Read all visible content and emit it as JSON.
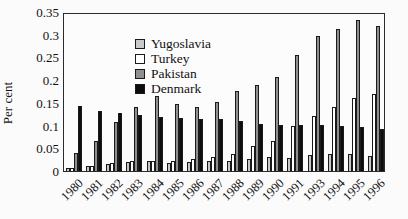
{
  "chart_data": {
    "type": "bar",
    "title": "",
    "xlabel": "",
    "ylabel": "Per cent",
    "ylim": [
      0,
      0.35
    ],
    "grid": false,
    "legend_position": "top-left-inside",
    "y_tick_labels": [
      "0",
      "0.05",
      "0.1",
      "0.15",
      "0.2",
      "0.25",
      "0.3",
      "0.35"
    ],
    "categories": [
      "1980",
      "1981",
      "1982",
      "1983",
      "1984",
      "1985",
      "1986",
      "1987",
      "1988",
      "1989",
      "1990",
      "1991",
      "1993",
      "1994",
      "1995",
      "1996"
    ],
    "series": [
      {
        "name": "Yugoslavia",
        "color": "#c9c9c9",
        "values": [
          0.007,
          0.01,
          0.016,
          0.02,
          0.021,
          0.018,
          0.019,
          0.021,
          0.023,
          0.027,
          0.031,
          0.029,
          0.036,
          0.037,
          0.037,
          0.034
        ]
      },
      {
        "name": "Turkey",
        "color": "#ffffff",
        "values": [
          0.007,
          0.011,
          0.018,
          0.021,
          0.023,
          0.023,
          0.026,
          0.03,
          0.038,
          0.055,
          0.067,
          0.1,
          0.12,
          0.141,
          0.161,
          0.17
        ]
      },
      {
        "name": "Pakistan",
        "color": "#8f8f8f",
        "values": [
          0.04,
          0.066,
          0.108,
          0.14,
          0.165,
          0.147,
          0.14,
          0.151,
          0.175,
          0.19,
          0.208,
          0.255,
          0.298,
          0.312,
          0.332,
          0.32
        ]
      },
      {
        "name": "Denmark",
        "color": "#0d0d0d",
        "values": [
          0.142,
          0.133,
          0.127,
          0.124,
          0.119,
          0.116,
          0.114,
          0.115,
          0.111,
          0.103,
          0.102,
          0.101,
          0.102,
          0.099,
          0.096,
          0.092
        ]
      }
    ]
  }
}
